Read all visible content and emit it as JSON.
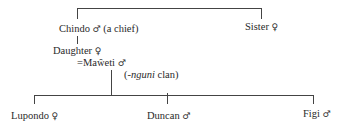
{
  "diagram": {
    "type": "kinship-chart",
    "generation1": {
      "chindo": {
        "name": "Chindo",
        "sex_symbol": "♂",
        "note": "(a chief)"
      },
      "sister": {
        "name": "Sister",
        "sex_symbol": "♀"
      }
    },
    "generation2": {
      "daughter": {
        "name": "Daughter",
        "sex_symbol": "♀"
      },
      "spouse": {
        "marriage_mark": "=",
        "name": "Maŵeti",
        "sex_symbol": "♂",
        "clan_prefix": "(-",
        "clan_name": "nguni",
        "clan_suffix": " clan)"
      }
    },
    "generation3": [
      {
        "name": "Lupondo",
        "sex_symbol": "♀"
      },
      {
        "name": "Duncan",
        "sex_symbol": "♂"
      },
      {
        "name": "Figi",
        "sex_symbol": "♂"
      }
    ]
  }
}
